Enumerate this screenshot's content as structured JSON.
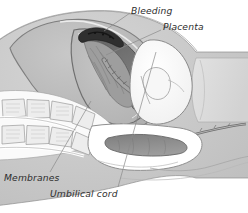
{
  "figure": {
    "type": "medical-illustration",
    "width": 248,
    "height": 213,
    "background_color": "#ffffff",
    "style": "grayscale pencil and wash anatomical drawing"
  },
  "labels": {
    "bleeding": "Bleeding",
    "placenta": "Placenta",
    "membranes": "Membranes",
    "umbilical_cord": "Umbilical cord"
  },
  "colors": {
    "label_text": "#2d2d2d",
    "leader_line": "#8a8a8a",
    "background": "#ffffff",
    "abdominal_wall": "#c9c9c9",
    "uterus_wall": "#b0b0b0",
    "uterus_cavity": "#bdbdbd",
    "placenta_dark": "#6e6e6e",
    "bleeding_dark": "#2f2f2f",
    "fetal_head": "#fbfbfb",
    "bone_light": "#ededed",
    "bone_outline": "#9a9a9a",
    "rectum": "#8e8e8e",
    "thigh_block": "#dcdcdc",
    "outline": "#787878"
  },
  "anatomy": [
    {
      "name": "abdominal-wall",
      "description": "outer maternal abdominal wall, light gray with white skin highlight"
    },
    {
      "name": "uterus",
      "description": "large oval uterine body occupying upper left and center"
    },
    {
      "name": "placenta",
      "description": "dark crescent mass along the upper inner uterine wall"
    },
    {
      "name": "bleeding",
      "description": "very dark region at the superior edge of the placenta"
    },
    {
      "name": "membranes",
      "description": "thin curved lining enclosing the amniotic cavity"
    },
    {
      "name": "umbilical-cord",
      "description": "twisted braided cord descending from the placenta"
    },
    {
      "name": "fetal-head",
      "description": "pale rounded fetal head engaged toward the birth canal on the right"
    },
    {
      "name": "sacrum-vertebrae",
      "description": "two curved rows of rectangular vertebral bodies in the lower left"
    },
    {
      "name": "rectum",
      "description": "elongated darker tube within a white field in the lower center"
    },
    {
      "name": "bladder",
      "description": "pale pocket anterior to the presenting part"
    },
    {
      "name": "thigh-block",
      "description": "light rectangular block of buttock and thigh tissue at the right"
    }
  ],
  "leader_lines": [
    {
      "name": "bleeding-leader",
      "from": [
        130,
        13
      ],
      "to": [
        104,
        31
      ]
    },
    {
      "name": "placenta-leader",
      "from": [
        161,
        30
      ],
      "to": [
        106,
        55
      ]
    },
    {
      "name": "membranes-leader",
      "from": [
        50,
        172
      ],
      "to": [
        91,
        101
      ]
    },
    {
      "name": "umbilical-leader",
      "from": [
        118,
        187
      ],
      "to": [
        156,
        52
      ]
    }
  ]
}
